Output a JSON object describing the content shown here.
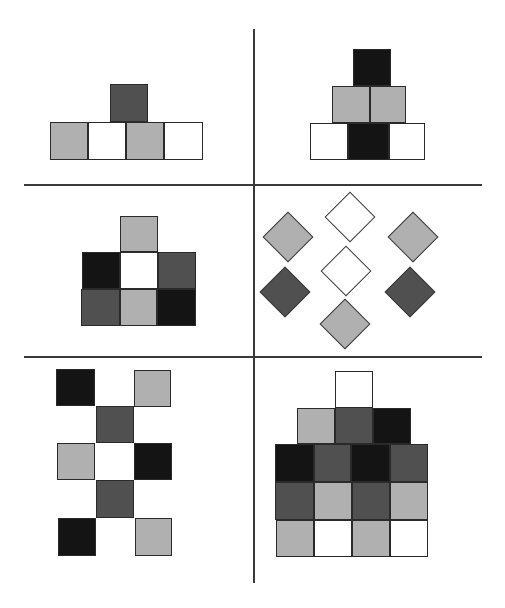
{
  "figure": {
    "colors": {
      "white": "#ffffff",
      "light_gray": "#b0b0b0",
      "dark_gray": "#505050",
      "black": "#141414",
      "line": "#3a3a3a"
    }
  },
  "dividers": [
    {
      "name": "vertical-divider",
      "x": 253,
      "y": 29,
      "w": 2,
      "h": 554
    },
    {
      "name": "horizontal-divider-top",
      "x": 24,
      "y": 184,
      "w": 458,
      "h": 2
    },
    {
      "name": "horizontal-divider-bottom",
      "x": 24,
      "y": 356,
      "w": 458,
      "h": 2
    }
  ],
  "panels": [
    {
      "id": "panel-1",
      "label": "Panel 1",
      "position": "top-left",
      "shape": "square",
      "tiles": [
        {
          "x": 110,
          "y": 84,
          "w": 38,
          "h": 38,
          "color": "dark_gray"
        },
        {
          "x": 50,
          "y": 122,
          "w": 38,
          "h": 38,
          "color": "light_gray"
        },
        {
          "x": 88,
          "y": 122,
          "w": 38,
          "h": 38,
          "color": "white"
        },
        {
          "x": 126,
          "y": 122,
          "w": 38,
          "h": 38,
          "color": "light_gray"
        },
        {
          "x": 164,
          "y": 122,
          "w": 39,
          "h": 38,
          "color": "white"
        }
      ]
    },
    {
      "id": "panel-2",
      "label": "Panel 2",
      "position": "top-right",
      "shape": "square",
      "tiles": [
        {
          "x": 353,
          "y": 49,
          "w": 38,
          "h": 37,
          "color": "black"
        },
        {
          "x": 332,
          "y": 86,
          "w": 38,
          "h": 37,
          "color": "light_gray"
        },
        {
          "x": 370,
          "y": 86,
          "w": 36,
          "h": 37,
          "color": "light_gray"
        },
        {
          "x": 310,
          "y": 123,
          "w": 38,
          "h": 37,
          "color": "white"
        },
        {
          "x": 348,
          "y": 123,
          "w": 41,
          "h": 37,
          "color": "black"
        },
        {
          "x": 389,
          "y": 123,
          "w": 36,
          "h": 37,
          "color": "white"
        }
      ]
    },
    {
      "id": "panel-3",
      "label": "Panel 3",
      "position": "middle-left",
      "shape": "square",
      "tiles": [
        {
          "x": 120,
          "y": 216,
          "w": 38,
          "h": 36,
          "color": "light_gray"
        },
        {
          "x": 82,
          "y": 252,
          "w": 38,
          "h": 37,
          "color": "black"
        },
        {
          "x": 120,
          "y": 252,
          "w": 38,
          "h": 37,
          "color": "white"
        },
        {
          "x": 158,
          "y": 252,
          "w": 38,
          "h": 37,
          "color": "dark_gray"
        },
        {
          "x": 81,
          "y": 289,
          "w": 39,
          "h": 37,
          "color": "dark_gray"
        },
        {
          "x": 120,
          "y": 289,
          "w": 37,
          "h": 37,
          "color": "light_gray"
        },
        {
          "x": 157,
          "y": 289,
          "w": 39,
          "h": 37,
          "color": "black"
        }
      ]
    },
    {
      "id": "panel-4",
      "label": "Panel 4",
      "position": "middle-right",
      "shape": "diamond",
      "tiles": [
        {
          "cx": 350,
          "cy": 217,
          "size": 36,
          "color": "white"
        },
        {
          "cx": 288,
          "cy": 237,
          "size": 36,
          "color": "light_gray"
        },
        {
          "cx": 413,
          "cy": 237,
          "size": 36,
          "color": "light_gray"
        },
        {
          "cx": 346,
          "cy": 271,
          "size": 36,
          "color": "white"
        },
        {
          "cx": 285,
          "cy": 292,
          "size": 36,
          "color": "dark_gray"
        },
        {
          "cx": 410,
          "cy": 292,
          "size": 36,
          "color": "dark_gray"
        },
        {
          "cx": 345,
          "cy": 324,
          "size": 36,
          "color": "light_gray"
        }
      ]
    },
    {
      "id": "panel-5",
      "label": "Panel 5",
      "position": "bottom-left",
      "shape": "square",
      "tiles": [
        {
          "x": 56,
          "y": 369,
          "w": 39,
          "h": 37,
          "color": "black"
        },
        {
          "x": 134,
          "y": 370,
          "w": 37,
          "h": 37,
          "color": "light_gray"
        },
        {
          "x": 96,
          "y": 406,
          "w": 38,
          "h": 37,
          "color": "dark_gray"
        },
        {
          "x": 57,
          "y": 443,
          "w": 38,
          "h": 37,
          "color": "light_gray"
        },
        {
          "x": 134,
          "y": 443,
          "w": 38,
          "h": 37,
          "color": "black"
        },
        {
          "x": 96,
          "y": 480,
          "w": 38,
          "h": 38,
          "color": "dark_gray"
        },
        {
          "x": 58,
          "y": 518,
          "w": 38,
          "h": 38,
          "color": "black"
        },
        {
          "x": 135,
          "y": 518,
          "w": 37,
          "h": 38,
          "color": "light_gray"
        }
      ]
    },
    {
      "id": "panel-6",
      "label": "Panel 6",
      "position": "bottom-right",
      "shape": "square",
      "tiles": [
        {
          "x": 335,
          "y": 371,
          "w": 38,
          "h": 37,
          "color": "white"
        },
        {
          "x": 297,
          "y": 408,
          "w": 38,
          "h": 36,
          "color": "light_gray"
        },
        {
          "x": 335,
          "y": 407,
          "w": 38,
          "h": 37,
          "color": "dark_gray"
        },
        {
          "x": 373,
          "y": 408,
          "w": 38,
          "h": 36,
          "color": "black"
        },
        {
          "x": 275,
          "y": 444,
          "w": 39,
          "h": 38,
          "color": "black"
        },
        {
          "x": 314,
          "y": 444,
          "w": 37,
          "h": 38,
          "color": "dark_gray"
        },
        {
          "x": 351,
          "y": 444,
          "w": 39,
          "h": 38,
          "color": "black"
        },
        {
          "x": 390,
          "y": 444,
          "w": 38,
          "h": 38,
          "color": "dark_gray"
        },
        {
          "x": 275,
          "y": 482,
          "w": 39,
          "h": 38,
          "color": "dark_gray"
        },
        {
          "x": 314,
          "y": 482,
          "w": 38,
          "h": 38,
          "color": "light_gray"
        },
        {
          "x": 352,
          "y": 482,
          "w": 38,
          "h": 38,
          "color": "dark_gray"
        },
        {
          "x": 390,
          "y": 482,
          "w": 38,
          "h": 38,
          "color": "light_gray"
        },
        {
          "x": 276,
          "y": 520,
          "w": 38,
          "h": 37,
          "color": "light_gray"
        },
        {
          "x": 314,
          "y": 520,
          "w": 38,
          "h": 37,
          "color": "white"
        },
        {
          "x": 352,
          "y": 520,
          "w": 38,
          "h": 37,
          "color": "light_gray"
        },
        {
          "x": 390,
          "y": 520,
          "w": 38,
          "h": 37,
          "color": "white"
        }
      ]
    }
  ]
}
